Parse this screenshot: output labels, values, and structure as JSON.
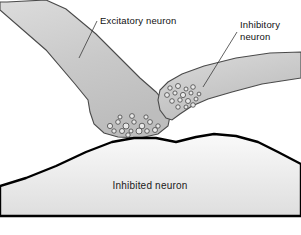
{
  "figure": {
    "background_color": "#ffffff",
    "width": 301,
    "height": 235,
    "drawing_bottom_y": 216
  },
  "colors": {
    "neuron_fill_light": "#d6d6d6",
    "neuron_fill_mid": "#c6c6c6",
    "neuron_fill_dark": "#b4b4b4",
    "target_fill_light": "#f2f2f2",
    "target_fill_dark": "#d8d8d8",
    "outline": "#4a4a4a",
    "target_outline": "#000000",
    "vesicle_fill": "#e9e9e9",
    "vesicle_stroke": "#3d3d3d",
    "leader_line": "#3a3a3a",
    "text": "#111111"
  },
  "labels": {
    "excitatory": {
      "text": "Excitatory neuron",
      "lines": [
        "Excitatory neuron"
      ],
      "x": 100,
      "y": 24,
      "anchor": "start"
    },
    "inhibitory": {
      "text": "Inhibitory neuron",
      "lines": [
        "Inhibitory",
        "neuron"
      ],
      "x": 240,
      "y": 28,
      "line_height": 12,
      "anchor": "start"
    },
    "inhibited": {
      "text": "Inhibited neuron",
      "lines": [
        "Inhibited neuron"
      ],
      "x": 150,
      "y": 189,
      "anchor": "middle"
    }
  },
  "leader_lines": {
    "excitatory": {
      "from_x": 97,
      "from_y": 21,
      "to_x": 79,
      "to_y": 58
    },
    "inhibitory": {
      "from_x": 237,
      "from_y": 32,
      "to_x": 203,
      "to_y": 87
    }
  },
  "shapes": {
    "excitatory_neuron": {
      "name": "excitatory-presynaptic-terminal",
      "path": "M 7 2 L 0 2 L 0 10 L 46 50 L 75 84 L 88 100 L 90 112 L 94 124 L 104 133 L 118 137 L 140 138 L 158 134 L 168 126 L 170 116 L 166 104 L 156 92 L 140 78 L 120 58 L 96 34 L 66 9 L 46 0 L 7 2 Z"
    },
    "inhibitory_neuron": {
      "name": "inhibitory-presynaptic-terminal",
      "path": "M 301 52 L 301 78 L 262 84 L 232 92 L 208 99 L 192 106 L 180 114 L 172 120 L 166 118 L 160 110 L 158 100 L 160 90 L 168 82 L 182 74 L 204 66 L 236 58 L 270 53 L 301 52 Z"
    },
    "inhibited_neuron": {
      "name": "postsynaptic-inhibited-neuron",
      "path": "M 0 216 L 0 186 L 26 178 L 56 166 L 86 152 L 112 142 L 134 138 L 156 138 L 176 142 L 196 137 L 214 134 L 236 136 L 258 142 L 278 152 L 301 164 L 301 216 Z"
    }
  },
  "vesicles": {
    "excitatory_cluster": {
      "name": "excitatory-vesicle-cluster",
      "count": 17,
      "items": [
        {
          "cx": 110,
          "cy": 126,
          "r": 2.6
        },
        {
          "cx": 118,
          "cy": 122,
          "r": 2.3
        },
        {
          "cx": 126,
          "cy": 126,
          "r": 3.0
        },
        {
          "cx": 134,
          "cy": 122,
          "r": 2.2
        },
        {
          "cx": 142,
          "cy": 126,
          "r": 2.8
        },
        {
          "cx": 150,
          "cy": 122,
          "r": 2.4
        },
        {
          "cx": 158,
          "cy": 126,
          "r": 2.2
        },
        {
          "cx": 114,
          "cy": 131,
          "r": 2.2
        },
        {
          "cx": 122,
          "cy": 131,
          "r": 2.5
        },
        {
          "cx": 131,
          "cy": 131,
          "r": 2.0
        },
        {
          "cx": 139,
          "cy": 131,
          "r": 3.0
        },
        {
          "cx": 147,
          "cy": 131,
          "r": 2.3
        },
        {
          "cx": 155,
          "cy": 130,
          "r": 2.5
        },
        {
          "cx": 120,
          "cy": 117,
          "r": 2.0
        },
        {
          "cx": 132,
          "cy": 116,
          "r": 2.4
        },
        {
          "cx": 146,
          "cy": 117,
          "r": 2.1
        },
        {
          "cx": 128,
          "cy": 135,
          "r": 2.2
        }
      ]
    },
    "inhibitory_cluster": {
      "name": "inhibitory-vesicle-cluster",
      "count": 16,
      "items": [
        {
          "cx": 170,
          "cy": 88,
          "r": 2.2
        },
        {
          "cx": 178,
          "cy": 86,
          "r": 2.5
        },
        {
          "cx": 186,
          "cy": 89,
          "r": 2.0
        },
        {
          "cx": 193,
          "cy": 87,
          "r": 2.3
        },
        {
          "cx": 167,
          "cy": 95,
          "r": 2.4
        },
        {
          "cx": 175,
          "cy": 93,
          "r": 2.1
        },
        {
          "cx": 183,
          "cy": 95,
          "r": 2.6
        },
        {
          "cx": 191,
          "cy": 93,
          "r": 2.0
        },
        {
          "cx": 172,
          "cy": 101,
          "r": 2.3
        },
        {
          "cx": 180,
          "cy": 100,
          "r": 2.2
        },
        {
          "cx": 188,
          "cy": 101,
          "r": 2.5
        },
        {
          "cx": 196,
          "cy": 99,
          "r": 2.0
        },
        {
          "cx": 178,
          "cy": 107,
          "r": 2.2
        },
        {
          "cx": 186,
          "cy": 107,
          "r": 2.0
        },
        {
          "cx": 193,
          "cy": 105,
          "r": 2.3
        },
        {
          "cx": 199,
          "cy": 94,
          "r": 1.9
        }
      ]
    }
  }
}
